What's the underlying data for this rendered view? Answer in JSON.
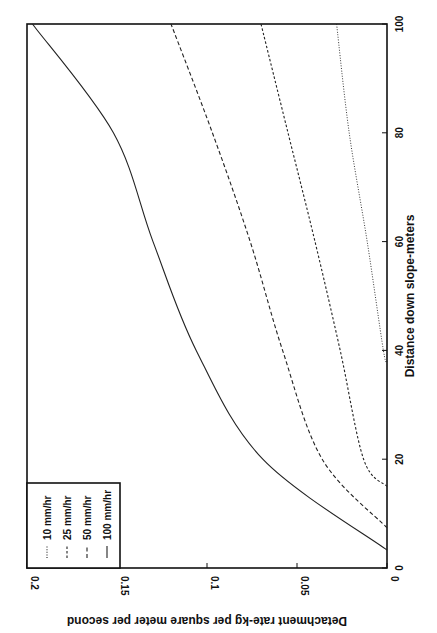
{
  "chart_data": {
    "type": "line",
    "orientation": "rotated-90-ccw",
    "title": "",
    "xlabel": "Distance down slope-meters",
    "ylabel": "Detachment rate-kg per square meter per second",
    "xlim": [
      0,
      100
    ],
    "ylim": [
      0,
      0.2
    ],
    "xticks": [
      0,
      20,
      40,
      60,
      80,
      100
    ],
    "xtick_labels": [
      "0",
      "20",
      "40",
      "60",
      "80",
      "100"
    ],
    "yticks": [
      0,
      0.05,
      0.1,
      0.15,
      0.2
    ],
    "ytick_labels": [
      "0",
      "0.05",
      "0.1",
      "0.15",
      "0.2"
    ],
    "grid": false,
    "legend_position": "upper-left (rotated view: bottom-left)",
    "series": [
      {
        "name": "10 mm/hr",
        "style": "dotted",
        "x": [
          38,
          40,
          60,
          80,
          100
        ],
        "y": [
          0,
          0.002,
          0.011,
          0.021,
          0.028
        ]
      },
      {
        "name": "25 mm/hr",
        "style": "dashed-fine",
        "x": [
          15,
          20,
          40,
          60,
          80,
          100
        ],
        "y": [
          0,
          0.013,
          0.026,
          0.04,
          0.055,
          0.07
        ]
      },
      {
        "name": "50 mm/hr",
        "style": "dashed",
        "x": [
          7.4,
          20,
          40,
          60,
          80,
          100
        ],
        "y": [
          0,
          0.036,
          0.058,
          0.076,
          0.097,
          0.12
        ]
      },
      {
        "name": "100 mm/hr",
        "style": "solid",
        "x": [
          3.3,
          20,
          40,
          60,
          80,
          100
        ],
        "y": [
          0,
          0.069,
          0.106,
          0.13,
          0.152,
          0.197
        ]
      }
    ]
  }
}
